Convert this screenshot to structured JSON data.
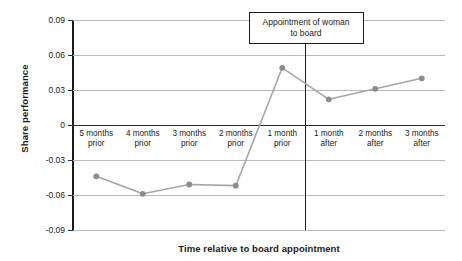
{
  "chart_data": {
    "type": "line",
    "title": "",
    "xlabel": "Time relative to board appointment",
    "ylabel": "Share performance",
    "categories": [
      "5 months\nprior",
      "4 months\nprior",
      "3 months\nprior",
      "2 months\nprior",
      "1 month\nprior",
      "1 month\nafter",
      "2 months\nafter",
      "3 months\nafter"
    ],
    "values": [
      -0.044,
      -0.059,
      -0.051,
      -0.052,
      0.049,
      0.022,
      0.031,
      0.04
    ],
    "series": [
      {
        "name": "Share performance",
        "values": [
          -0.044,
          -0.059,
          -0.051,
          -0.052,
          0.049,
          0.022,
          0.031,
          0.04
        ]
      }
    ],
    "ylim": [
      -0.09,
      0.09
    ],
    "ytick_labels": [
      "0.09",
      "0.06",
      "0.03",
      "0",
      "-0.03",
      "-0.06",
      "-0.09"
    ],
    "ytick_values": [
      0.09,
      0.06,
      0.03,
      0,
      -0.03,
      -0.06,
      -0.09
    ],
    "grid": true,
    "legend": "none",
    "annotations": [
      {
        "name": "event-marker",
        "text": "Appointment of woman\nto board",
        "at_category_boundary": "between 1 month prior and 1 month after"
      }
    ],
    "colors": {
      "line": "#a6a6a6",
      "marker": "#8c8c8c",
      "gridline": "#b9b9b9",
      "axis": "#1a1a1a",
      "background": "#ffffff"
    }
  }
}
